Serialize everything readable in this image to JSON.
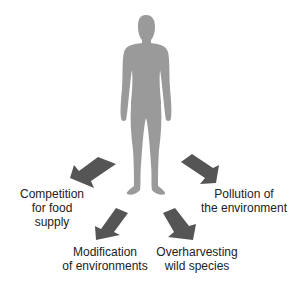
{
  "diagram": {
    "center": {
      "name": "human-figure",
      "fill": "#9a9a9a"
    },
    "arrow_color": "#555555",
    "impacts": [
      {
        "id": "competition",
        "lines": [
          "Competition",
          "for food",
          "supply"
        ]
      },
      {
        "id": "pollution",
        "lines": [
          "Pollution of",
          "the environment"
        ]
      },
      {
        "id": "modification",
        "lines": [
          "Modification",
          "of environments"
        ]
      },
      {
        "id": "overharvesting",
        "lines": [
          "Overharvesting",
          "wild species"
        ]
      }
    ]
  }
}
